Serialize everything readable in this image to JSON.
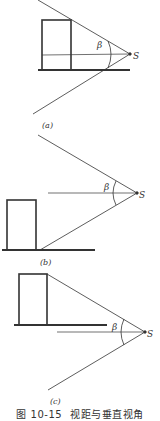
{
  "figure": {
    "caption_number": "图 10-15",
    "caption_title": "视距与垂直视角",
    "panels": [
      {
        "label": "(a)",
        "angle_label": "β",
        "point_label": "S"
      },
      {
        "label": "(b)",
        "angle_label": "β",
        "point_label": "S"
      },
      {
        "label": "(c)",
        "angle_label": "β",
        "point_label": "S"
      }
    ]
  },
  "colors": {
    "line": "#333333",
    "background": "#ffffff"
  }
}
